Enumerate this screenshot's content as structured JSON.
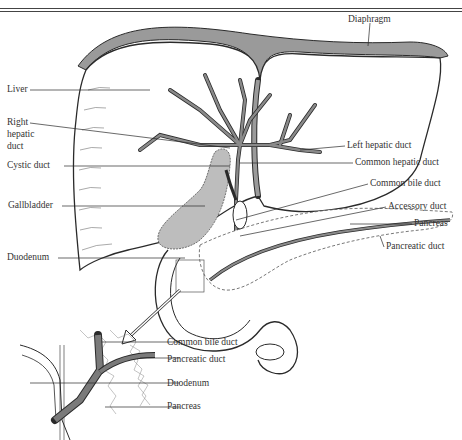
{
  "main_labels": {
    "diaphragm": "Diaphragm",
    "liver": "Liver",
    "right_hepatic_duct_1": "Right",
    "right_hepatic_duct_2": "hepatic",
    "right_hepatic_duct_3": "duct",
    "cystic_duct": "Cystic duct",
    "gallbladder": "Gallbladder",
    "duodenum": "Duodenum",
    "left_hepatic_duct": "Left hepatic duct",
    "common_hepatic_duct": "Common hepatic duct",
    "common_bile_duct": "Common bile duct",
    "accessory_duct": "Accessory duct",
    "pancreas": "Pancreas",
    "pancreatic_duct": "Pancreatic duct"
  },
  "inset_labels": {
    "common_bile_duct": "Common bile duct",
    "pancreatic_duct": "Pancreatic duct",
    "duodenum": "Duodenum",
    "pancreas": "Pancreas"
  },
  "colors": {
    "line": "#2a2a2a",
    "organ_fill": "#ffffff",
    "duct_fill": "#8a8a8a",
    "gallbladder_fill": "#bdbdbd",
    "diaphragm_fill": "#9a9a9a"
  }
}
